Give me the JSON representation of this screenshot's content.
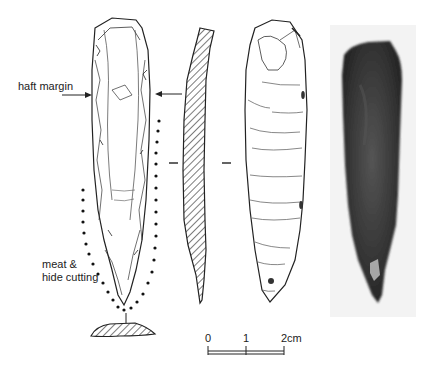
{
  "figure": {
    "annotations": {
      "haft_margin": "haft margin",
      "use_zone_line1": "meat &",
      "use_zone_line2": "hide cutting"
    },
    "scale_bar": {
      "ticks": [
        "0",
        "1",
        "2cm"
      ],
      "unit": "cm",
      "length_cm": 2
    },
    "views": [
      "dorsal-drawing",
      "profile-section",
      "ventral-drawing",
      "cross-section",
      "photograph"
    ],
    "colors": {
      "ink": "#222222",
      "photo_background": "#f3f3f3",
      "artifact_dark": "#3a3a3a"
    }
  }
}
